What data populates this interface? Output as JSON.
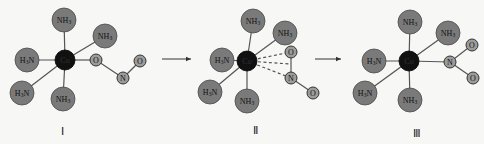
{
  "diagram": {
    "center_atom": "Co",
    "ammine_label": "NH3",
    "ammine_label_left": "H3N",
    "structures": [
      {
        "id": "I",
        "roman": "Ⅰ",
        "ligand_type": "nitrito (O-bonded)",
        "small_atoms": [
          {
            "label": "O"
          },
          {
            "label": "N"
          },
          {
            "label": "O"
          }
        ]
      },
      {
        "id": "II",
        "roman": "Ⅱ",
        "ligand_type": "transition state (dashed bonds)",
        "small_atoms": [
          {
            "label": "O"
          },
          {
            "label": "N"
          },
          {
            "label": "O"
          }
        ]
      },
      {
        "id": "III",
        "roman": "Ⅲ",
        "ligand_type": "nitro (N-bonded)",
        "small_atoms": [
          {
            "label": "N"
          },
          {
            "label": "O"
          },
          {
            "label": "O"
          }
        ]
      }
    ],
    "arrows": [
      "I-to-II",
      "II-to-III"
    ]
  }
}
